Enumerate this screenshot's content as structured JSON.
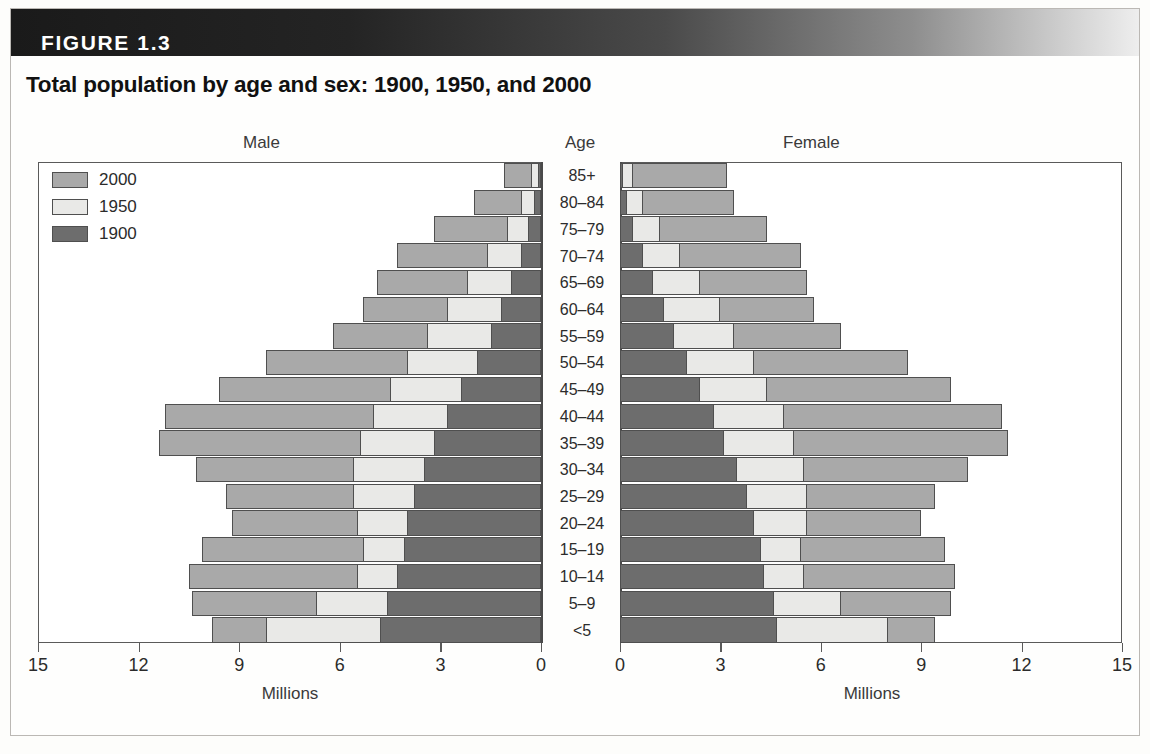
{
  "figure": {
    "label": "FIGURE 1.3",
    "title": "Total population by age and sex: 1900, 1950, and 2000"
  },
  "headings": {
    "male": "Male",
    "age": "Age",
    "female": "Female"
  },
  "legend": {
    "items": [
      {
        "label": "2000",
        "color": "#a9a9a9"
      },
      {
        "label": "1950",
        "color": "#e9e9e7"
      },
      {
        "label": "1900",
        "color": "#6d6d6d"
      }
    ]
  },
  "axes": {
    "left_ticks": [
      "15",
      "12",
      "9",
      "6",
      "3",
      "0"
    ],
    "right_ticks": [
      "0",
      "3",
      "6",
      "9",
      "12",
      "15"
    ],
    "left_caption": "Millions",
    "right_caption": "Millions",
    "max": 15,
    "tick_step": 3
  },
  "chart_data": {
    "type": "bar",
    "subtype": "population-pyramid",
    "title": "Total population by age and sex: 1900, 1950, and 2000",
    "xlabel": "Millions",
    "ylabel": "Age",
    "xlim": [
      0,
      15
    ],
    "grid": false,
    "legend_position": "top-left",
    "units": "millions",
    "categories": [
      "85+",
      "80–84",
      "75–79",
      "70–74",
      "65–69",
      "60–64",
      "55–59",
      "50–54",
      "45–49",
      "40–44",
      "35–39",
      "30–34",
      "25–29",
      "20–24",
      "15–19",
      "10–14",
      "5–9",
      "<5"
    ],
    "sides": [
      {
        "name": "Male",
        "direction": "left",
        "series": [
          {
            "name": "2000",
            "color": "#a9a9a9",
            "values": [
              1.1,
              2.0,
              3.2,
              4.3,
              4.9,
              5.3,
              6.2,
              8.2,
              9.6,
              11.2,
              11.4,
              10.3,
              9.4,
              9.2,
              10.1,
              10.5,
              10.4,
              9.8
            ]
          },
          {
            "name": "1950",
            "color": "#e9e9e7",
            "values": [
              0.3,
              0.6,
              1.0,
              1.6,
              2.2,
              2.8,
              3.4,
              4.0,
              4.5,
              5.0,
              5.4,
              5.6,
              5.6,
              5.5,
              5.3,
              5.5,
              6.7,
              8.2
            ]
          },
          {
            "name": "1900",
            "color": "#6d6d6d",
            "values": [
              0.1,
              0.2,
              0.4,
              0.6,
              0.9,
              1.2,
              1.5,
              1.9,
              2.4,
              2.8,
              3.2,
              3.5,
              3.8,
              4.0,
              4.1,
              4.3,
              4.6,
              4.8
            ]
          }
        ]
      },
      {
        "name": "Female",
        "direction": "right",
        "series": [
          {
            "name": "2000",
            "color": "#a9a9a9",
            "values": [
              3.2,
              3.4,
              4.4,
              5.4,
              5.6,
              5.8,
              6.6,
              8.6,
              9.9,
              11.4,
              11.6,
              10.4,
              9.4,
              9.0,
              9.7,
              10.0,
              9.9,
              9.4
            ]
          },
          {
            "name": "1950",
            "color": "#e9e9e7",
            "values": [
              0.4,
              0.7,
              1.2,
              1.8,
              2.4,
              3.0,
              3.4,
              4.0,
              4.4,
              4.9,
              5.2,
              5.5,
              5.6,
              5.6,
              5.4,
              5.5,
              6.6,
              8.0
            ]
          },
          {
            "name": "1900",
            "color": "#6d6d6d",
            "values": [
              0.1,
              0.2,
              0.4,
              0.7,
              1.0,
              1.3,
              1.6,
              2.0,
              2.4,
              2.8,
              3.1,
              3.5,
              3.8,
              4.0,
              4.2,
              4.3,
              4.6,
              4.7
            ]
          }
        ]
      }
    ]
  }
}
